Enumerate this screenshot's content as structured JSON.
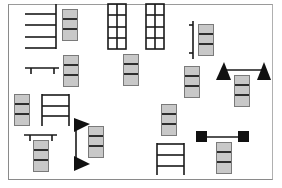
{
  "diagram": {
    "type": "equipment-layout-floor-plan",
    "colors": {
      "frame": "#8a8a8a",
      "stack_fill": "#c8c8c8",
      "stack_divider": "#2e2e2e",
      "symbol": "#1a1a1a"
    },
    "stacks": [
      {
        "id": "stack-1",
        "x": 62,
        "y": 9,
        "cells": 3
      },
      {
        "id": "stack-2",
        "x": 63,
        "y": 55,
        "cells": 3
      },
      {
        "id": "stack-3",
        "x": 123,
        "y": 54,
        "cells": 3
      },
      {
        "id": "stack-4",
        "x": 198,
        "y": 24,
        "cells": 3
      },
      {
        "id": "stack-5",
        "x": 184,
        "y": 66,
        "cells": 3
      },
      {
        "id": "stack-6",
        "x": 234,
        "y": 75,
        "cells": 3
      },
      {
        "id": "stack-7",
        "x": 14,
        "y": 94,
        "cells": 3
      },
      {
        "id": "stack-8",
        "x": 88,
        "y": 126,
        "cells": 3
      },
      {
        "id": "stack-9",
        "x": 33,
        "y": 140,
        "cells": 3
      },
      {
        "id": "stack-10",
        "x": 161,
        "y": 104,
        "cells": 3
      },
      {
        "id": "stack-11",
        "x": 216,
        "y": 142,
        "cells": 3
      }
    ],
    "symbols": [
      {
        "id": "rack-four-rails",
        "kind": "horizontal rails with vertical post"
      },
      {
        "id": "grid-rack-left",
        "kind": "2x4 grid rack"
      },
      {
        "id": "grid-rack-right",
        "kind": "2x4 grid rack"
      },
      {
        "id": "bench-top-left",
        "kind": "bench with legs"
      },
      {
        "id": "bracket-vertical",
        "kind": "vertical bracket"
      },
      {
        "id": "triangle-bar-horizontal",
        "kind": "bar with triangle ends"
      },
      {
        "id": "ladder-left",
        "kind": "three-rung ladder"
      },
      {
        "id": "bench-bottom-left",
        "kind": "bench with legs"
      },
      {
        "id": "triangle-bar-vertical",
        "kind": "vertical bar with triangle ends"
      },
      {
        "id": "dumbbell-horizontal",
        "kind": "bar with square ends"
      },
      {
        "id": "ladder-bottom",
        "kind": "three-rung ladder"
      }
    ]
  }
}
